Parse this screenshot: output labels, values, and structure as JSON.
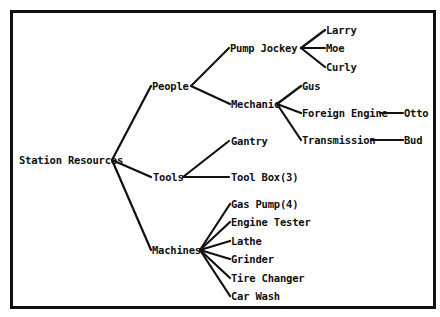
{
  "diagram": {
    "type": "tree",
    "root": {
      "label": "Station Resources",
      "children": [
        {
          "label": "People",
          "children": [
            {
              "label": "Pump Jockey",
              "children": [
                {
                  "label": "Larry"
                },
                {
                  "label": "Moe"
                },
                {
                  "label": "Curly"
                }
              ]
            },
            {
              "label": "Mechanic",
              "children": [
                {
                  "label": "Gus"
                },
                {
                  "label": "Foreign Engine",
                  "children": [
                    {
                      "label": "Otto"
                    }
                  ]
                },
                {
                  "label": "Transmission",
                  "children": [
                    {
                      "label": "Bud"
                    }
                  ]
                }
              ]
            }
          ]
        },
        {
          "label": "Tools",
          "children": [
            {
              "label": "Gantry"
            },
            {
              "label": "Tool Box(3)"
            }
          ]
        },
        {
          "label": "Machines",
          "children": [
            {
              "label": "Gas Pump(4)"
            },
            {
              "label": "Engine Tester"
            },
            {
              "label": "Lathe"
            },
            {
              "label": "Grinder"
            },
            {
              "label": "Tire Changer"
            },
            {
              "label": "Car Wash"
            }
          ]
        }
      ]
    }
  },
  "labels": {
    "root": "Station Resources",
    "people": "People",
    "tools": "Tools",
    "machines": "Machines",
    "pump_jockey": "Pump Jockey",
    "mechanic": "Mechanic",
    "larry": "Larry",
    "moe": "Moe",
    "curly": "Curly",
    "gus": "Gus",
    "foreign_engine": "Foreign Engine",
    "transmission": "Transmission",
    "otto": "Otto",
    "bud": "Bud",
    "gantry": "Gantry",
    "tool_box": "Tool Box(3)",
    "gas_pump": "Gas Pump(4)",
    "engine_tester": "Engine Tester",
    "lathe": "Lathe",
    "grinder": "Grinder",
    "tire_changer": "Tire Changer",
    "car_wash": "Car Wash"
  },
  "colors": {
    "ink": "#111111",
    "background": "#ffffff"
  }
}
